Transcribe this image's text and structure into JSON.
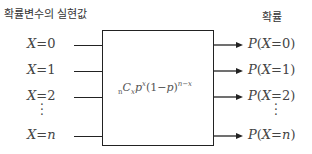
{
  "headers": {
    "left": "확률변수의 실현값",
    "right": "확률"
  },
  "inputs": [
    {
      "var": "X",
      "eq": "=",
      "val": "0"
    },
    {
      "var": "X",
      "eq": "=",
      "val": "1"
    },
    {
      "var": "X",
      "eq": "=",
      "val": "2"
    },
    {
      "var": "X",
      "eq": "=",
      "val": "n"
    }
  ],
  "outputs": [
    {
      "pre": "P(",
      "var": "X",
      "eq": "=",
      "val": "0",
      "post": ")"
    },
    {
      "pre": "P(",
      "var": "X",
      "eq": "=",
      "val": "1",
      "post": ")"
    },
    {
      "pre": "P(",
      "var": "X",
      "eq": "=",
      "val": "2",
      "post": ")"
    },
    {
      "pre": "P(",
      "var": "X",
      "eq": "=",
      "val": "n",
      "post": ")"
    }
  ],
  "ellipsis": "⋮",
  "formula": {
    "n_sub": "n",
    "C": "C",
    "x_sub": "x",
    "p": "p",
    "x_sup": "x",
    "paren": "(1−",
    "p2": "p",
    "close": ")",
    "exp": "n−x"
  }
}
